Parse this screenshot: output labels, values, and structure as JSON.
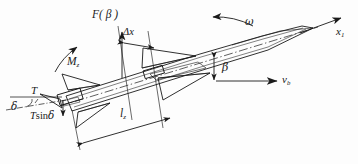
{
  "figure": {
    "kind": "engineering-diagram",
    "background_color": "#fdfdfd",
    "line_color": "#1a1a1a",
    "text_color": "#1a1a1a"
  },
  "labels": {
    "aero_force": "F( β )",
    "delta_x": "Δx",
    "omega": "ω",
    "body_axis": "x",
    "body_axis_sub": "1",
    "moment": "M",
    "moment_sub": "z",
    "beta": "β",
    "velocity": "v",
    "velocity_sub": "b",
    "thrust": "T",
    "delta": "δ",
    "thrust_lateral_main": "T",
    "thrust_lateral_fn": "sin",
    "thrust_lateral_arg": "δ",
    "length": "l",
    "length_sub": "z"
  },
  "annotations": {
    "aero_force_desc": "aerodynamic normal force as function of sideslip angle",
    "delta_x_desc": "longitudinal offset of aerodynamic force from reference station",
    "omega_desc": "body angular rate (pitch/yaw rotation arrow)",
    "body_axis_desc": "body-fixed longitudinal axis",
    "moment_desc": "aerodynamic restoring moment",
    "beta_desc": "sideslip angle between body axis and velocity vector",
    "velocity_desc": "body velocity vector",
    "thrust_desc": "engine thrust vector",
    "delta_desc": "thrust deflection angle",
    "thrust_lateral_desc": "lateral thrust component",
    "length_desc": "moment arm from tail to reference station"
  }
}
